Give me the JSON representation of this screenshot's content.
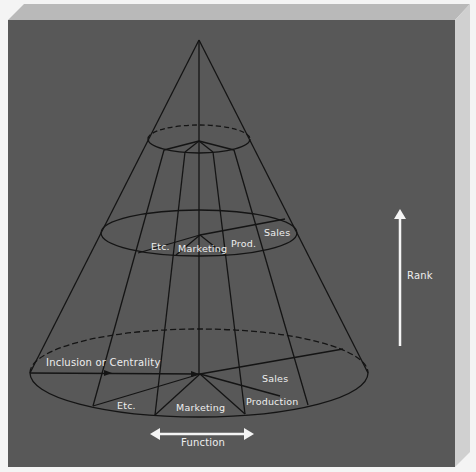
{
  "figure": {
    "colors": {
      "panel": "#585858",
      "bevel_top": "#b8b8b8",
      "bevel_right": "#cfcfcf",
      "line": "#141414",
      "label": "#eeeeee",
      "arrow": "#f4f4f4"
    },
    "labels": {
      "upper_level": {
        "etc": "Etc.",
        "marketing": "Marketing",
        "prod": "Prod.",
        "sales": "Sales"
      },
      "base_level": {
        "inclusion": "Inclusion or Centrality",
        "etc": "Etc.",
        "marketing": "Marketing",
        "production": "Production",
        "sales": "Sales"
      },
      "axes": {
        "rank": "Rank",
        "function": "Function"
      }
    }
  }
}
